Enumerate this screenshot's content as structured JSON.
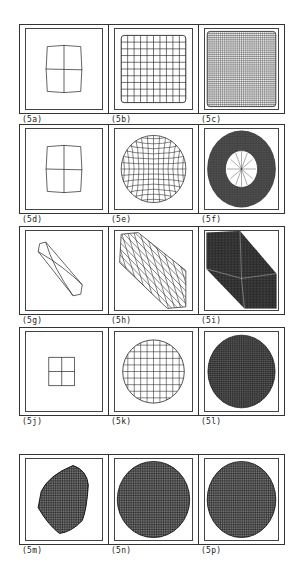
{
  "figure": {
    "layout": {
      "rows": 5,
      "cols": 3
    },
    "panels": [
      {
        "id": "5a",
        "label": "(5a)",
        "shape": "square",
        "grid": 2,
        "style": "coarse"
      },
      {
        "id": "5b",
        "label": "(5b)",
        "shape": "square",
        "grid": 10,
        "style": "medium"
      },
      {
        "id": "5c",
        "label": "(5c)",
        "shape": "square",
        "grid": 36,
        "style": "dense"
      },
      {
        "id": "5d",
        "label": "(5d)",
        "shape": "square",
        "grid": 2,
        "style": "coarse"
      },
      {
        "id": "5e",
        "label": "(5e)",
        "shape": "circle-bulge",
        "grid": 12,
        "style": "medium"
      },
      {
        "id": "5f",
        "label": "(5f)",
        "shape": "annulus",
        "grid": 40,
        "style": "dense"
      },
      {
        "id": "5g",
        "label": "(5g)",
        "shape": "diamond",
        "grid": 2,
        "style": "coarse"
      },
      {
        "id": "5h",
        "label": "(5h)",
        "shape": "hexagon-skew",
        "grid": 10,
        "style": "medium"
      },
      {
        "id": "5i",
        "label": "(5i)",
        "shape": "hexagon-skew-dense",
        "grid": 36,
        "style": "dense"
      },
      {
        "id": "5j",
        "label": "(5j)",
        "shape": "small-square",
        "grid": 2,
        "style": "coarse"
      },
      {
        "id": "5k",
        "label": "(5k)",
        "shape": "circle",
        "grid": 12,
        "style": "medium"
      },
      {
        "id": "5l",
        "label": "(5l)",
        "shape": "circle",
        "grid": 40,
        "style": "dense"
      },
      {
        "id": "5m",
        "label": "(5m)",
        "shape": "blob",
        "grid": 30,
        "style": "dense"
      },
      {
        "id": "5n",
        "label": "(5n)",
        "shape": "circle-large",
        "grid": 36,
        "style": "dense"
      },
      {
        "id": "5p",
        "label": "(5p)",
        "shape": "circle-large",
        "grid": 36,
        "style": "dense"
      }
    ]
  }
}
